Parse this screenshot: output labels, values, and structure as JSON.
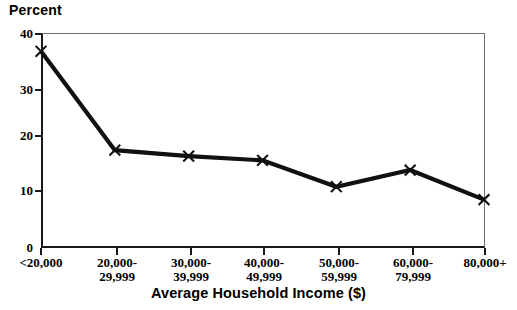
{
  "chart_data": {
    "type": "line",
    "title": "",
    "ylabel": "Percent",
    "xlabel": "Average Household Income ($)",
    "categories": [
      "<20,000",
      "20,000-\n29,999",
      "30,000-\n39,999",
      "40,000-\n49,999",
      "50,000-\n59,999",
      "60,000-\n79,999",
      "80,000+"
    ],
    "category_lines": [
      [
        "<20,000",
        ""
      ],
      [
        "20,000-",
        "29,999"
      ],
      [
        "30,000-",
        "39,999"
      ],
      [
        "40,000-",
        "49,999"
      ],
      [
        "50,000-",
        "59,999"
      ],
      [
        "60,000-",
        "79,999"
      ],
      [
        "80,000+",
        ""
      ]
    ],
    "values": [
      36.6,
      18.2,
      17.1,
      16.3,
      11.4,
      14.5,
      9.0
    ],
    "ylim": [
      0,
      40
    ],
    "y_ticks": [
      0,
      10,
      20,
      30,
      40
    ],
    "y_tick_labels": [
      "0",
      "10",
      "20",
      "30",
      "40"
    ],
    "grid": false,
    "legend": "none",
    "marker": "x",
    "line_color": "#111111",
    "marker_color": "#111111",
    "axis_color": "#1a1a1a"
  }
}
